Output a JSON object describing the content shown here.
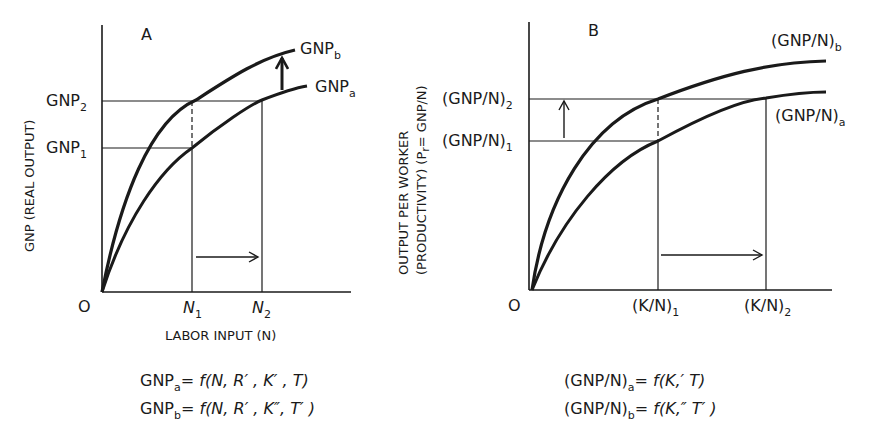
{
  "panel_a": {
    "title": "A",
    "y_axis_label": "GNP (REAL OUTPUT)",
    "x_axis_label": "LABOR INPUT (N)",
    "origin": "O",
    "x_ticks": [
      {
        "base": "N",
        "sub": "1"
      },
      {
        "base": "N",
        "sub": "2"
      }
    ],
    "y_ticks": [
      {
        "base": "GNP",
        "sub": "2"
      },
      {
        "base": "GNP",
        "sub": "1"
      }
    ],
    "curves": [
      {
        "base": "GNP",
        "sub": "b"
      },
      {
        "base": "GNP",
        "sub": "a"
      }
    ],
    "equations": [
      {
        "lhs_base": "GNP",
        "lhs_sub": "a",
        "rhs": "= f(N, R′ , K′ , T)"
      },
      {
        "lhs_base": "GNP",
        "lhs_sub": "b",
        "rhs": "= f(N, R′ , K″, T′ )"
      }
    ]
  },
  "panel_b": {
    "title": "B",
    "y_axis_label_line1": "OUTPUT PER WORKER",
    "y_axis_label_line2": "(PRODUCTIVITY) (P",
    "y_axis_label_sub": "r",
    "y_axis_label_tail": "= GNP/N)",
    "origin": "O",
    "x_ticks": [
      {
        "base": "(K/N)",
        "sub": "1"
      },
      {
        "base": "(K/N)",
        "sub": "2"
      }
    ],
    "y_ticks": [
      {
        "base": "(GNP/N)",
        "sub": "2"
      },
      {
        "base": "(GNP/N)",
        "sub": "1"
      }
    ],
    "curves": [
      {
        "base": "(GNP/N)",
        "sub": "b"
      },
      {
        "base": "(GNP/N)",
        "sub": "a"
      }
    ],
    "equations": [
      {
        "lhs_base": "(GNP/N)",
        "lhs_sub": "a",
        "rhs": "= f(K,′ T)"
      },
      {
        "lhs_base": "(GNP/N)",
        "lhs_sub": "b",
        "rhs": "= f(K,″ T′ )"
      }
    ]
  }
}
